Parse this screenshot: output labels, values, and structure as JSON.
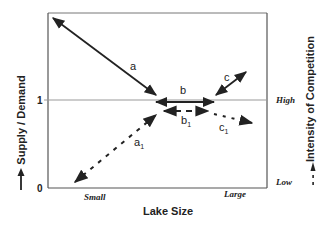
{
  "diagram": {
    "y_axis_left": {
      "title": "Supply / Demand",
      "ticks": [
        "0",
        "1"
      ],
      "legend_marker": "solid-arrow"
    },
    "y_axis_right": {
      "title": "Intensity of Competition",
      "ticks": [
        "Low",
        "High"
      ],
      "legend_marker": "dashed-arrow"
    },
    "x_axis": {
      "title": "Lake Size",
      "ticks": [
        "Small",
        "Large"
      ]
    },
    "reference_line": {
      "label": "1",
      "right_label": "High"
    },
    "arrows": [
      {
        "id": "a",
        "label": "a",
        "style": "solid",
        "heads": "both",
        "from": "top-left",
        "to": "center"
      },
      {
        "id": "b",
        "label": "b",
        "style": "solid",
        "heads": "both",
        "orientation": "horizontal"
      },
      {
        "id": "c",
        "label": "c",
        "style": "solid",
        "heads": "both",
        "from": "center",
        "to": "upper-right"
      },
      {
        "id": "a1",
        "label": "a",
        "subscript": "1",
        "style": "dashed",
        "heads": "both",
        "from": "bottom-left",
        "to": "center"
      },
      {
        "id": "b1",
        "label": "b",
        "subscript": "1",
        "style": "dashed",
        "heads": "both",
        "orientation": "horizontal"
      },
      {
        "id": "c1",
        "label": "c",
        "subscript": "1",
        "style": "dashed",
        "heads": "one",
        "direction": "right"
      }
    ],
    "colors": {
      "line": "#222222",
      "frame": "#555555",
      "reference": "#999999"
    }
  }
}
